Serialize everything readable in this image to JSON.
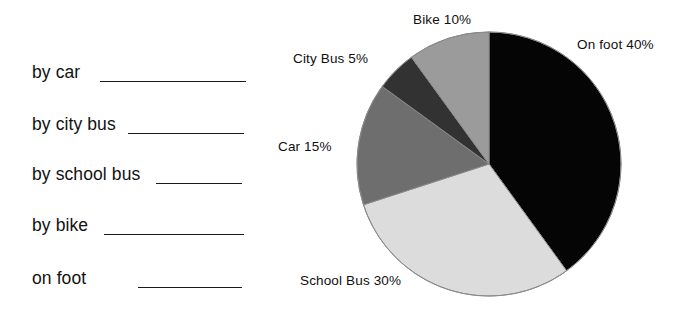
{
  "worksheet": {
    "rows": [
      {
        "label": "by car",
        "blank_width": 146,
        "label_left": 32,
        "blank_left": 100,
        "top": 62
      },
      {
        "label": "by city bus",
        "blank_width": 116,
        "label_left": 32,
        "blank_left": 128,
        "top": 114
      },
      {
        "label": "by school bus",
        "blank_width": 86,
        "label_left": 32,
        "blank_left": 156,
        "top": 164
      },
      {
        "label": "by bike",
        "blank_width": 140,
        "label_left": 32,
        "blank_left": 104,
        "top": 215
      },
      {
        "label": "on foot",
        "blank_width": 104,
        "label_left": 32,
        "blank_left": 138,
        "top": 268
      }
    ]
  },
  "chart_data": {
    "type": "pie",
    "title": "",
    "start_angle_deg": 0,
    "direction": "clockwise",
    "legend": "labels-outside",
    "categories": [
      "On foot",
      "School Bus",
      "Car",
      "City Bus",
      "Bike"
    ],
    "values": [
      40,
      30,
      15,
      5,
      10
    ],
    "unit": "%",
    "labels": [
      {
        "name": "On foot",
        "value": 40,
        "text": "On foot 40%",
        "left": 277,
        "top": 37,
        "align": "left"
      },
      {
        "name": "School Bus",
        "value": 30,
        "text": "School Bus 30%",
        "left": 0,
        "top": 273,
        "align": "left"
      },
      {
        "name": "Car",
        "value": 15,
        "text": "Car 15%",
        "left": -22,
        "top": 139,
        "align": "left"
      },
      {
        "name": "City Bus",
        "value": 5,
        "text": "City Bus 5%",
        "left": -7,
        "top": 51,
        "align": "left"
      },
      {
        "name": "Bike",
        "value": 10,
        "text": "Bike 10%",
        "left": 113,
        "top": 12,
        "align": "left"
      }
    ],
    "colors": {
      "On foot": "#050505",
      "School Bus": "#dcdcdc",
      "Car": "#6e6e6e",
      "City Bus": "#323232",
      "Bike": "#9b9b9b"
    },
    "outline_color": "#8a8a8a",
    "center": {
      "x": 189,
      "y": 164
    },
    "radius": 132
  }
}
